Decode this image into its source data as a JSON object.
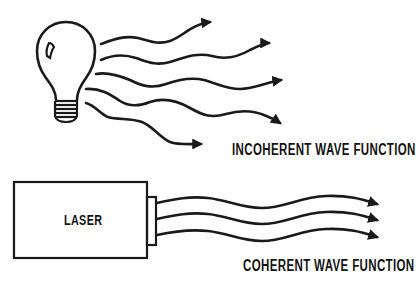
{
  "diagram": {
    "top_section": {
      "source": "light-bulb",
      "wave_count": 5,
      "label": "INCOHERENT WAVE FUNCTION"
    },
    "bottom_section": {
      "source_label": "LASER",
      "wave_count": 3,
      "label": "COHERENT WAVE FUNCTION"
    }
  },
  "colors": {
    "ink": "#1a1a1a",
    "background": "#ffffff"
  }
}
